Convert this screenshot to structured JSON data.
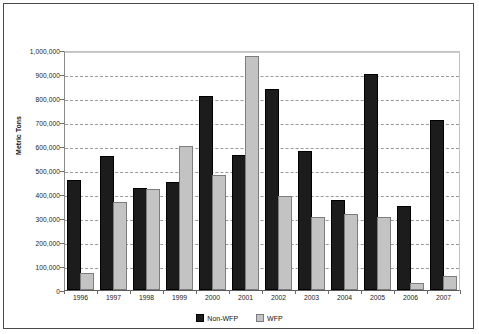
{
  "chart_data": {
    "type": "bar",
    "title": "",
    "xlabel": "",
    "ylabel": "Metric Tons",
    "ylim": [
      0,
      1000000
    ],
    "ytick_step": 100000,
    "grid": true,
    "legend_position": "bottom-center",
    "categories": [
      "1996",
      "1997",
      "1998",
      "1999",
      "2000",
      "2001",
      "2002",
      "2003",
      "2004",
      "2005",
      "2006",
      "2007"
    ],
    "series": [
      {
        "name": "Non-WFP",
        "color": "#1c1c1c",
        "values": [
          450000,
          550000,
          418000,
          440000,
          800000,
          555000,
          830000,
          570000,
          365000,
          890000,
          340000,
          700000
        ]
      },
      {
        "name": "WFP",
        "color": "#c3c3c3",
        "values": [
          62000,
          360000,
          412000,
          590000,
          470000,
          965000,
          385000,
          295000,
          310000,
          295000,
          22000,
          50000
        ]
      }
    ],
    "ytick_labels": [
      "0",
      "100,000",
      "200,000",
      "300,000",
      "400,000",
      "500,000",
      "600,000",
      "700,000",
      "800,000",
      "900,000",
      "1,000,000"
    ],
    "ytick_values": [
      0,
      100000,
      200000,
      300000,
      400000,
      500000,
      600000,
      700000,
      800000,
      900000,
      1000000
    ]
  }
}
